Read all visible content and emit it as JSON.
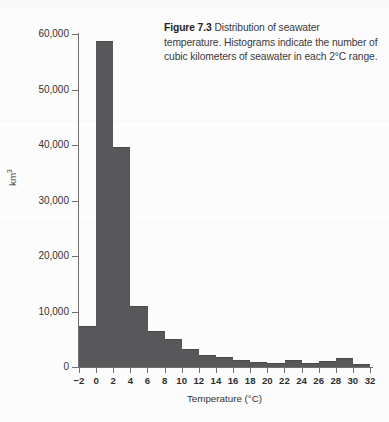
{
  "caption": {
    "figure_number": "Figure 7.3",
    "text": " Distribution of seawater temperature. Histograms indicate the number of cubic kilometers of seawater in each 2°C range."
  },
  "axes": {
    "y_title_base": "km",
    "y_title_exponent": "3",
    "x_title": "Temperature (°C)",
    "y_tick_labels": [
      "0",
      "10,000",
      "20,000",
      "30,000",
      "40,000",
      "50,000",
      "60,000"
    ],
    "y_tick_values": [
      0,
      10000,
      20000,
      30000,
      40000,
      50000,
      60000
    ],
    "x_tick_labels": [
      "−2",
      "0",
      "2",
      "4",
      "6",
      "8",
      "10",
      "12",
      "14",
      "16",
      "18",
      "20",
      "22",
      "24",
      "26",
      "28",
      "30",
      "32"
    ],
    "x_tick_values": [
      -2,
      0,
      2,
      4,
      6,
      8,
      10,
      12,
      14,
      16,
      18,
      20,
      22,
      24,
      26,
      28,
      30,
      32
    ]
  },
  "colors": {
    "bar_fill": "#58585a",
    "axis": "#6f6f6f",
    "text": "#2b2b2b",
    "page": "#fcfcfc"
  },
  "chart_data": {
    "type": "bar",
    "title": "Distribution of seawater temperature",
    "xlabel": "Temperature (°C)",
    "ylabel": "km3",
    "xlim": [
      -2,
      32
    ],
    "ylim": [
      0,
      60000
    ],
    "bin_width": 2,
    "grid": false,
    "legend": "none",
    "categories": [
      "-2 to 0",
      "0 to 2",
      "2 to 4",
      "4 to 6",
      "6 to 8",
      "8 to 10",
      "10 to 12",
      "12 to 14",
      "14 to 16",
      "16 to 18",
      "18 to 20",
      "20 to 22",
      "22 to 24",
      "24 to 26",
      "26 to 28",
      "28 to 30",
      "30 to 32"
    ],
    "bin_starts": [
      -2,
      0,
      2,
      4,
      6,
      8,
      10,
      12,
      14,
      16,
      18,
      20,
      22,
      24,
      26,
      28,
      30
    ],
    "values": [
      7400,
      58700,
      39600,
      11000,
      6500,
      5000,
      3200,
      2100,
      1800,
      1200,
      900,
      800,
      1300,
      700,
      1100,
      1600,
      500
    ]
  }
}
